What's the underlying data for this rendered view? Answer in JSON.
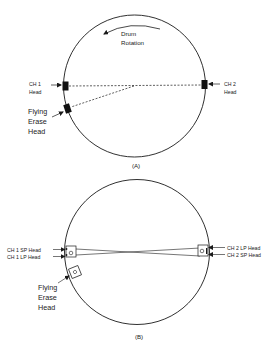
{
  "figure": {
    "colors": {
      "ink": "#1a1a1a",
      "label": "#222222",
      "background": "#ffffff"
    },
    "diagram_a": {
      "caption": "(A)",
      "rotation_label_line1": "Drum",
      "rotation_label_line2": "Rotation",
      "ch1_label_line1": "CH 1",
      "ch1_label_line2": "Head",
      "ch2_label_line1": "CH 2",
      "ch2_label_line2": "Head",
      "erase_label_line1": "Flying",
      "erase_label_line2": "Erase",
      "erase_label_line3": "Head"
    },
    "diagram_b": {
      "caption": "(B)",
      "ch1_sp_label": "CH 1 SP Head",
      "ch1_lp_label": "CH 1 LP Head",
      "ch2_lp_label": "CH 2 LP Head",
      "ch2_sp_label": "CH 2 SP Head",
      "erase_label_line1": "Flying",
      "erase_label_line2": "Erase",
      "erase_label_line3": "Head"
    }
  }
}
